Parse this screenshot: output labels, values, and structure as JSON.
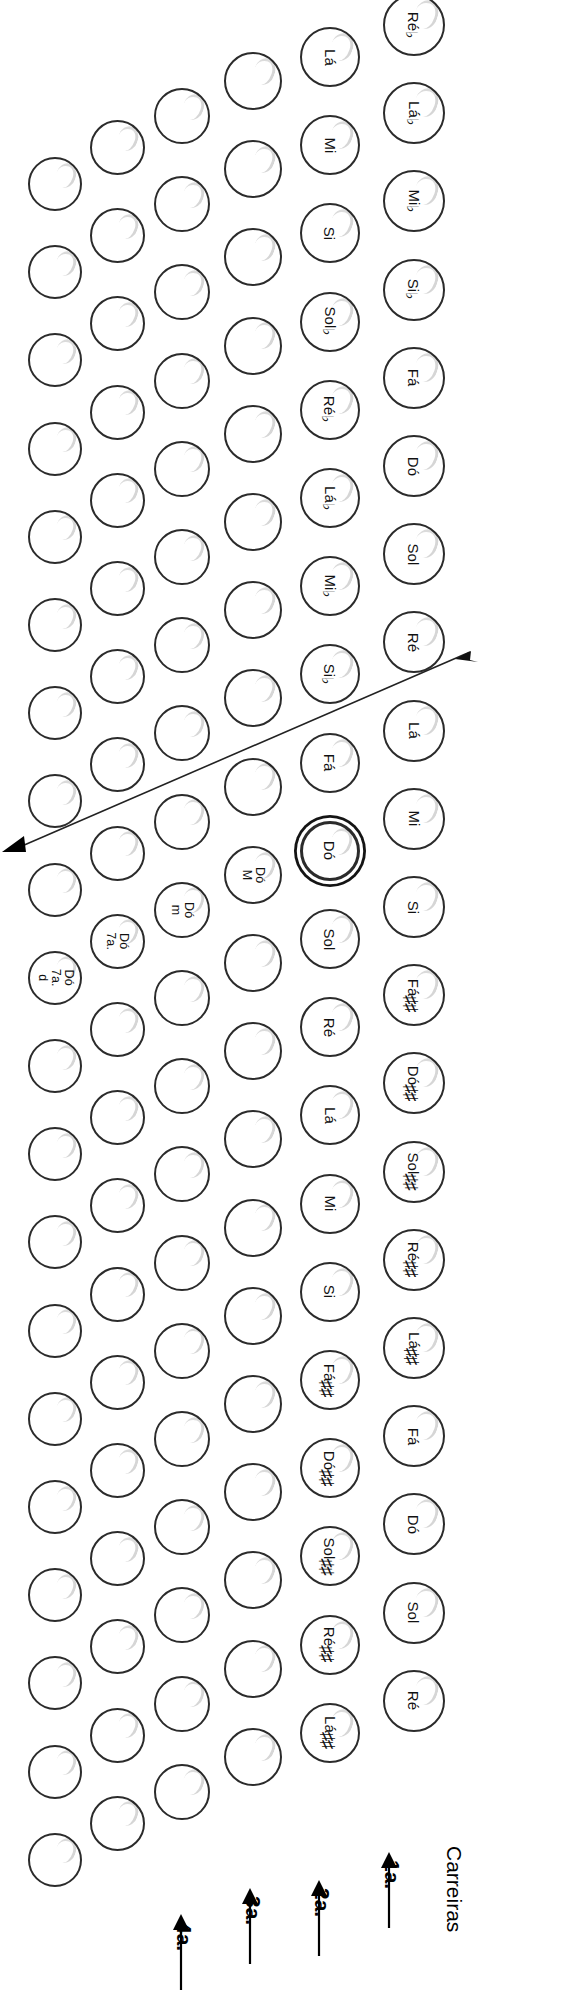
{
  "diagram": {
    "title": "Carreiras",
    "rows_label_text": "Carreiras",
    "row_markers": [
      {
        "id": "1a",
        "label": "1a."
      },
      {
        "id": "2a",
        "label": "2a."
      },
      {
        "id": "3a",
        "label": "3a."
      },
      {
        "id": "4a",
        "label": "4a."
      }
    ],
    "selected_button": "Dó",
    "accent_color": "#2b2b2b",
    "columns": [
      {
        "name": "row-1",
        "index": 1,
        "labeled": true,
        "buttons": [
          {
            "note": "Réb",
            "accidental": "flat"
          },
          {
            "note": "Láb",
            "accidental": "flat"
          },
          {
            "note": "Mib",
            "accidental": "flat"
          },
          {
            "note": "Sib",
            "accidental": "flat"
          },
          {
            "note": "Fá",
            "accidental": "none"
          },
          {
            "note": "Dó",
            "accidental": "none"
          },
          {
            "note": "Sol",
            "accidental": "none"
          },
          {
            "note": "Ré",
            "accidental": "none"
          },
          {
            "note": "Lá",
            "accidental": "none"
          },
          {
            "note": "Mi",
            "accidental": "none"
          },
          {
            "note": "Si",
            "accidental": "none"
          },
          {
            "note": "Fá#",
            "accidental": "sharp"
          },
          {
            "note": "Dó#",
            "accidental": "sharp"
          },
          {
            "note": "Sol#",
            "accidental": "sharp"
          },
          {
            "note": "Ré#",
            "accidental": "sharp"
          },
          {
            "note": "Lá#",
            "accidental": "sharp"
          },
          {
            "note": "Fá",
            "accidental": "none"
          },
          {
            "note": "Dó",
            "accidental": "none"
          },
          {
            "note": "Sol",
            "accidental": "none"
          },
          {
            "note": "Ré",
            "accidental": "none"
          }
        ]
      },
      {
        "name": "row-2",
        "index": 2,
        "labeled": true,
        "buttons": [
          {
            "note": "Lá",
            "accidental": "none"
          },
          {
            "note": "Mi",
            "accidental": "none"
          },
          {
            "note": "Si",
            "accidental": "none"
          },
          {
            "note": "Solb",
            "accidental": "flat"
          },
          {
            "note": "Réb",
            "accidental": "flat"
          },
          {
            "note": "Láb",
            "accidental": "flat"
          },
          {
            "note": "Mib",
            "accidental": "flat"
          },
          {
            "note": "Sib",
            "accidental": "flat"
          },
          {
            "note": "Fá",
            "accidental": "none"
          },
          {
            "note": "Dó",
            "accidental": "none",
            "selected": true
          },
          {
            "note": "Sol",
            "accidental": "none"
          },
          {
            "note": "Ré",
            "accidental": "none"
          },
          {
            "note": "Lá",
            "accidental": "none"
          },
          {
            "note": "Mi",
            "accidental": "none"
          },
          {
            "note": "Si",
            "accidental": "none"
          },
          {
            "note": "Fá#",
            "accidental": "sharp"
          },
          {
            "note": "Dó#",
            "accidental": "sharp"
          },
          {
            "note": "Sol#",
            "accidental": "sharp"
          },
          {
            "note": "Ré#",
            "accidental": "sharp"
          },
          {
            "note": "Lá#",
            "accidental": "sharp"
          }
        ]
      },
      {
        "name": "row-3",
        "index": 3,
        "labeled": false,
        "buttons": [
          {
            "note": ""
          },
          {
            "note": ""
          },
          {
            "note": ""
          },
          {
            "note": ""
          },
          {
            "note": ""
          },
          {
            "note": ""
          },
          {
            "note": ""
          },
          {
            "note": ""
          },
          {
            "note": ""
          },
          {
            "note": "Dó M",
            "chord": true
          },
          {
            "note": ""
          },
          {
            "note": ""
          },
          {
            "note": ""
          },
          {
            "note": ""
          },
          {
            "note": ""
          },
          {
            "note": ""
          },
          {
            "note": ""
          },
          {
            "note": ""
          },
          {
            "note": ""
          },
          {
            "note": ""
          }
        ]
      },
      {
        "name": "row-4",
        "index": 4,
        "labeled": false,
        "buttons": [
          {
            "note": ""
          },
          {
            "note": ""
          },
          {
            "note": ""
          },
          {
            "note": ""
          },
          {
            "note": ""
          },
          {
            "note": ""
          },
          {
            "note": ""
          },
          {
            "note": ""
          },
          {
            "note": ""
          },
          {
            "note": "Dó m",
            "chord": true
          },
          {
            "note": ""
          },
          {
            "note": ""
          },
          {
            "note": ""
          },
          {
            "note": ""
          },
          {
            "note": ""
          },
          {
            "note": ""
          },
          {
            "note": ""
          },
          {
            "note": ""
          },
          {
            "note": ""
          },
          {
            "note": ""
          }
        ]
      },
      {
        "name": "row-5",
        "index": 5,
        "labeled": false,
        "buttons": [
          {
            "note": ""
          },
          {
            "note": ""
          },
          {
            "note": ""
          },
          {
            "note": ""
          },
          {
            "note": ""
          },
          {
            "note": ""
          },
          {
            "note": ""
          },
          {
            "note": ""
          },
          {
            "note": ""
          },
          {
            "note": "Dó 7a.",
            "chord": true
          },
          {
            "note": ""
          },
          {
            "note": ""
          },
          {
            "note": ""
          },
          {
            "note": ""
          },
          {
            "note": ""
          },
          {
            "note": ""
          },
          {
            "note": ""
          },
          {
            "note": ""
          },
          {
            "note": ""
          },
          {
            "note": ""
          }
        ]
      },
      {
        "name": "row-6",
        "index": 6,
        "labeled": false,
        "buttons": [
          {
            "note": ""
          },
          {
            "note": ""
          },
          {
            "note": ""
          },
          {
            "note": ""
          },
          {
            "note": ""
          },
          {
            "note": ""
          },
          {
            "note": ""
          },
          {
            "note": ""
          },
          {
            "note": ""
          },
          {
            "note": "Dó 7a. d",
            "chord": true
          },
          {
            "note": ""
          },
          {
            "note": ""
          },
          {
            "note": ""
          },
          {
            "note": ""
          },
          {
            "note": ""
          },
          {
            "note": ""
          },
          {
            "note": ""
          },
          {
            "note": ""
          },
          {
            "note": ""
          },
          {
            "note": ""
          }
        ]
      }
    ]
  }
}
